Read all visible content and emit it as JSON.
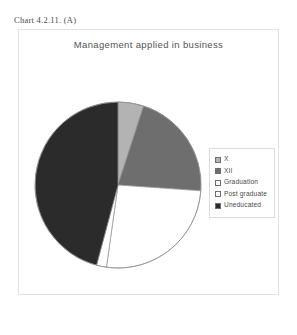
{
  "caption": "Chart 4.2.11. (A)",
  "chart_title": "Management applied in business",
  "legend": {
    "items": [
      {
        "label": "X",
        "swatch_icon": "legend-swatch-gray",
        "color": "#b3b3b3"
      },
      {
        "label": "XII",
        "swatch_icon": "legend-swatch-dark-gray",
        "color": "#6e6e6e"
      },
      {
        "label": "Graduation",
        "swatch_icon": "legend-swatch-white",
        "color": "#ffffff"
      },
      {
        "label": "Post graduate",
        "swatch_icon": "legend-swatch-white",
        "color": "#ffffff"
      },
      {
        "label": "Uneducated",
        "swatch_icon": "legend-swatch-black",
        "color": "#2b2b2b"
      }
    ]
  },
  "chart_data": {
    "type": "pie",
    "title": "Management applied in business",
    "xlabel": "",
    "ylabel": "",
    "legend_position": "right",
    "grid": false,
    "start_angle_deg": 0,
    "direction": "clockwise",
    "categories": [
      "X",
      "XII",
      "Graduation",
      "Post graduate",
      "Uneducated"
    ],
    "values": [
      5,
      21,
      26,
      2,
      46
    ],
    "units": "percent",
    "slice_angles_deg": [
      18,
      76,
      94,
      7,
      165
    ],
    "colors": [
      "#b3b3b3",
      "#6e6e6e",
      "#ffffff",
      "#ffffff",
      "#2b2b2b"
    ]
  }
}
